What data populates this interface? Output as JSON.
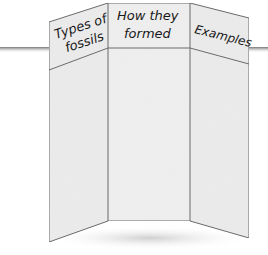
{
  "figure": {
    "type": "tri-fold display board illustration",
    "panels": [
      {
        "position": "left",
        "heading_lines": [
          "Types of",
          "fossils"
        ]
      },
      {
        "position": "center",
        "heading_lines": [
          "How they",
          "formed"
        ]
      },
      {
        "position": "right",
        "heading_lines": [
          "Examples"
        ]
      }
    ],
    "colors": {
      "board_fill": "#ededed",
      "board_edge": "#6b6b6b",
      "table_line": "#8a8a8a",
      "shadow": "#d4d4d4",
      "text": "#1a1a1a"
    }
  }
}
